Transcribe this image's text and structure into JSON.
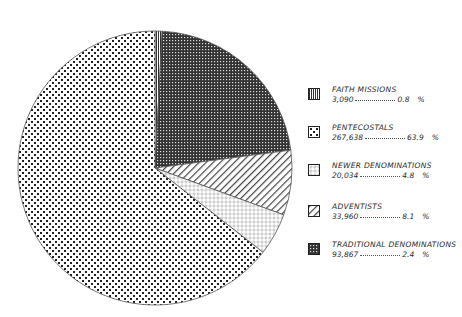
{
  "chart_data": {
    "type": "pie",
    "title": "",
    "start_angle": "12 o'clock, clockwise",
    "slices": [
      {
        "label": "FAITH MISSIONS",
        "count": "3,090",
        "percent": 0.8,
        "pattern": "vertical-lines"
      },
      {
        "label": "TRADITIONAL DENOMINATIONS",
        "count": "93,867",
        "percent_label": "2.4",
        "visual_percent": 22,
        "pattern": "dense-checker"
      },
      {
        "label": "ADVENTISTS",
        "count": "33,960",
        "percent": 8.1,
        "pattern": "diagonal-hatch"
      },
      {
        "label": "NEWER DENOMINATIONS",
        "count": "20,034",
        "percent": 4.8,
        "pattern": "small-circles"
      },
      {
        "label": "PENTECOSTALS",
        "count": "267,638",
        "percent": 63.9,
        "pattern": "large-dots"
      }
    ],
    "angles_deg": [
      [
        0,
        3
      ],
      [
        3,
        82.5
      ],
      [
        82.5,
        110
      ],
      [
        110,
        128
      ],
      [
        128,
        360
      ]
    ],
    "legend_position": "right"
  },
  "legend": {
    "items": [
      {
        "label": "FAITH MISSIONS",
        "count": "3,090",
        "pct": "0.8",
        "unit": "%"
      },
      {
        "label": "PENTECOSTALS",
        "count": "267,638",
        "pct": "63.9",
        "unit": "%"
      },
      {
        "label": "NEWER DENOMINATIONS",
        "count": "20,034",
        "pct": "4.8",
        "unit": "%"
      },
      {
        "label": "ADVENTISTS",
        "count": "33,960",
        "pct": "8.1",
        "unit": "%"
      },
      {
        "label": "TRADITIONAL DENOMINATIONS",
        "count": "93,867",
        "pct": "2.4",
        "unit": "%"
      }
    ]
  }
}
